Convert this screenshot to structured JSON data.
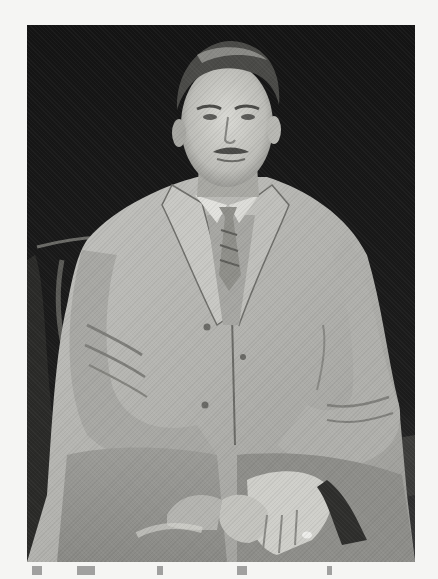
{
  "image": {
    "subject": "Studio portrait of a seated man in a light-colored three-piece suit and striped tie, hands clasped on lap",
    "style": "black-and-white halftone photograph",
    "colors": {
      "page_background": "#f5f5f3",
      "photo_background": "#161616",
      "suit": "#b9b9b5",
      "suit_shadow": "#7a7a76",
      "skin": "#cfcfca",
      "hair": "#3a3a38",
      "tie": "#8f8f8a"
    }
  }
}
